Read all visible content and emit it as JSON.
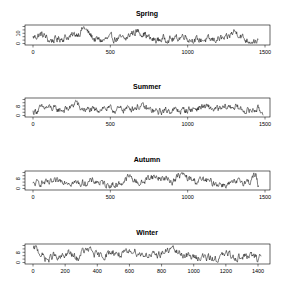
{
  "chart_data": [
    {
      "type": "line",
      "title": "Spring",
      "xlabel": "",
      "ylabel": "",
      "x_ticks": [
        0,
        500,
        1000,
        1500
      ],
      "y_ticks": [
        0,
        10
      ],
      "y_tick_labels": [
        "0",
        "10"
      ],
      "xlim": [
        0,
        1500
      ],
      "ylim": [
        0,
        17
      ],
      "n_points": 1460,
      "grid": false,
      "series_profile": [
        [
          0,
          6
        ],
        [
          50,
          9
        ],
        [
          80,
          7
        ],
        [
          100,
          3
        ],
        [
          150,
          4
        ],
        [
          200,
          6
        ],
        [
          250,
          7
        ],
        [
          300,
          11
        ],
        [
          330,
          16
        ],
        [
          360,
          10
        ],
        [
          400,
          4
        ],
        [
          450,
          3
        ],
        [
          500,
          5
        ],
        [
          550,
          5
        ],
        [
          600,
          4
        ],
        [
          640,
          11
        ],
        [
          680,
          12
        ],
        [
          720,
          10
        ],
        [
          760,
          4
        ],
        [
          800,
          3
        ],
        [
          850,
          5
        ],
        [
          900,
          4
        ],
        [
          950,
          6
        ],
        [
          980,
          9
        ],
        [
          1000,
          5
        ],
        [
          1050,
          3
        ],
        [
          1100,
          4
        ],
        [
          1150,
          3
        ],
        [
          1200,
          5
        ],
        [
          1250,
          4
        ],
        [
          1280,
          9
        ],
        [
          1300,
          12
        ],
        [
          1330,
          10
        ],
        [
          1370,
          4
        ],
        [
          1400,
          3
        ],
        [
          1460,
          2
        ]
      ]
    },
    {
      "type": "line",
      "title": "Summer",
      "xlabel": "",
      "ylabel": "",
      "x_ticks": [
        0,
        500,
        1000,
        1500
      ],
      "y_ticks": [
        0,
        8
      ],
      "y_tick_labels": [
        "0",
        "8"
      ],
      "xlim": [
        0,
        1500
      ],
      "ylim": [
        0,
        14
      ],
      "n_points": 1490,
      "grid": false,
      "series_profile": [
        [
          0,
          3
        ],
        [
          50,
          6
        ],
        [
          100,
          7
        ],
        [
          150,
          5
        ],
        [
          200,
          5
        ],
        [
          250,
          7
        ],
        [
          280,
          13
        ],
        [
          300,
          6
        ],
        [
          350,
          5
        ],
        [
          400,
          4
        ],
        [
          450,
          7
        ],
        [
          500,
          5
        ],
        [
          550,
          5
        ],
        [
          600,
          6
        ],
        [
          650,
          7
        ],
        [
          700,
          8
        ],
        [
          750,
          5
        ],
        [
          800,
          3
        ],
        [
          850,
          4
        ],
        [
          900,
          5
        ],
        [
          950,
          4
        ],
        [
          1000,
          5
        ],
        [
          1050,
          6
        ],
        [
          1100,
          8
        ],
        [
          1150,
          6
        ],
        [
          1200,
          5
        ],
        [
          1250,
          7
        ],
        [
          1300,
          8
        ],
        [
          1350,
          5
        ],
        [
          1400,
          4
        ],
        [
          1450,
          6
        ],
        [
          1490,
          2
        ]
      ]
    },
    {
      "type": "line",
      "title": "Autumn",
      "xlabel": "",
      "ylabel": "",
      "x_ticks": [
        0,
        500,
        1000,
        1500
      ],
      "y_ticks": [
        0,
        8
      ],
      "y_tick_labels": [
        "0",
        "8"
      ],
      "xlim": [
        0,
        1500
      ],
      "ylim": [
        0,
        13
      ],
      "n_points": 1460,
      "grid": false,
      "series_profile": [
        [
          0,
          3
        ],
        [
          50,
          5
        ],
        [
          100,
          4
        ],
        [
          150,
          5
        ],
        [
          200,
          7
        ],
        [
          250,
          5
        ],
        [
          300,
          4
        ],
        [
          350,
          5
        ],
        [
          400,
          6
        ],
        [
          450,
          4
        ],
        [
          500,
          3
        ],
        [
          550,
          3
        ],
        [
          600,
          7
        ],
        [
          620,
          10
        ],
        [
          660,
          6
        ],
        [
          700,
          4
        ],
        [
          760,
          10
        ],
        [
          800,
          9
        ],
        [
          850,
          8
        ],
        [
          900,
          6
        ],
        [
          960,
          12
        ],
        [
          1000,
          8
        ],
        [
          1050,
          6
        ],
        [
          1100,
          7
        ],
        [
          1150,
          5
        ],
        [
          1200,
          4
        ],
        [
          1250,
          3
        ],
        [
          1300,
          4
        ],
        [
          1350,
          6
        ],
        [
          1400,
          5
        ],
        [
          1420,
          10
        ],
        [
          1440,
          11
        ],
        [
          1460,
          0
        ]
      ]
    },
    {
      "type": "line",
      "title": "Winter",
      "xlabel": "",
      "ylabel": "",
      "x_ticks": [
        0,
        200,
        400,
        600,
        800,
        1000,
        1200,
        1400
      ],
      "y_ticks": [
        0,
        8
      ],
      "y_tick_labels": [
        "0",
        "8"
      ],
      "xlim": [
        0,
        1400
      ],
      "ylim": [
        0,
        14
      ],
      "n_points": 1420,
      "grid": false,
      "series_profile": [
        [
          0,
          10
        ],
        [
          20,
          12
        ],
        [
          60,
          5
        ],
        [
          100,
          2
        ],
        [
          130,
          7
        ],
        [
          150,
          2
        ],
        [
          200,
          6
        ],
        [
          220,
          8
        ],
        [
          280,
          2
        ],
        [
          300,
          9
        ],
        [
          360,
          10
        ],
        [
          400,
          5
        ],
        [
          450,
          6
        ],
        [
          500,
          9
        ],
        [
          550,
          6
        ],
        [
          600,
          8
        ],
        [
          620,
          11
        ],
        [
          660,
          7
        ],
        [
          700,
          7
        ],
        [
          750,
          5
        ],
        [
          800,
          8
        ],
        [
          850,
          10
        ],
        [
          870,
          12
        ],
        [
          900,
          8
        ],
        [
          950,
          6
        ],
        [
          1000,
          4
        ],
        [
          1050,
          5
        ],
        [
          1100,
          3
        ],
        [
          1150,
          3
        ],
        [
          1200,
          7
        ],
        [
          1250,
          5
        ],
        [
          1300,
          4
        ],
        [
          1350,
          6
        ],
        [
          1400,
          3
        ],
        [
          1420,
          7
        ]
      ]
    }
  ],
  "panels": [
    {
      "title": "Spring"
    },
    {
      "title": "Summer"
    },
    {
      "title": "Autumn"
    },
    {
      "title": "Winter"
    }
  ]
}
